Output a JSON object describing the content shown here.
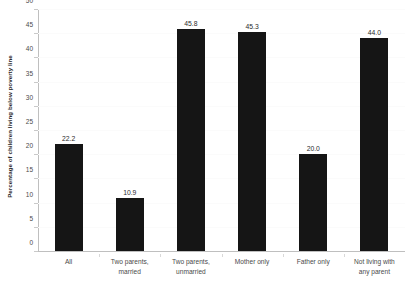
{
  "chart_data": {
    "type": "bar",
    "title": "",
    "xlabel": "",
    "ylabel": "Percentage of children living below poverty line",
    "categories": [
      "All",
      "Two parents, married",
      "Two parents, unmarried",
      "Mother only",
      "Father only",
      "Not living with any parent"
    ],
    "category_lines": [
      [
        "All"
      ],
      [
        "Two parents,",
        "married"
      ],
      [
        "Two parents,",
        "unmarried"
      ],
      [
        "Mother only"
      ],
      [
        "Father only"
      ],
      [
        "Not living with",
        "any parent"
      ]
    ],
    "values": [
      22.2,
      10.9,
      45.8,
      45.3,
      20.0,
      44.0
    ],
    "value_labels": [
      "22.2",
      "10.9",
      "45.8",
      "45.3",
      "20.0",
      "44.0"
    ],
    "ylim": [
      0,
      50
    ],
    "ytick_values": [
      0,
      5,
      10,
      15,
      20,
      25,
      30,
      35,
      40,
      45,
      50
    ],
    "ytick_labels": [
      "0",
      "5",
      "10",
      "15",
      "20",
      "25",
      "30",
      "35",
      "40",
      "45",
      "50"
    ],
    "grid": false,
    "legend": "none",
    "bar_color": "#151515",
    "axis_color": "#bfbfbf",
    "text_color": "#4a4a4a",
    "background": "#ffffff"
  }
}
